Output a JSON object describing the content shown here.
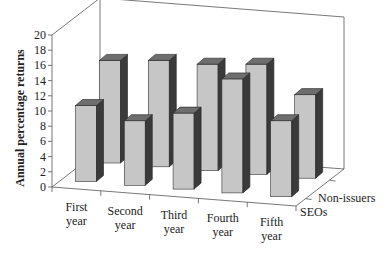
{
  "chart_data": {
    "type": "bar",
    "variant": "3d-grouped",
    "title": "",
    "xlabel": "",
    "ylabel": "Annual percentage returns",
    "ylim": [
      0,
      20
    ],
    "yticks": [
      0,
      2,
      4,
      6,
      8,
      10,
      12,
      14,
      16,
      18,
      20
    ],
    "categories": [
      "First year",
      "Second year",
      "Third year",
      "Fourth year",
      "Fifth year"
    ],
    "category_lines": [
      [
        "First",
        "year"
      ],
      [
        "Second",
        "year"
      ],
      [
        "Third",
        "year"
      ],
      [
        "Fourth",
        "year"
      ],
      [
        "Fifth",
        "year"
      ]
    ],
    "series": [
      {
        "name": "SEOs",
        "values": [
          10,
          8.5,
          10,
          15,
          10
        ]
      },
      {
        "name": "Non-issuers",
        "values": [
          13.5,
          14,
          14,
          14.5,
          11
        ]
      }
    ],
    "depth_labels": [
      "Non-issuers",
      "SEOs"
    ],
    "grid": false,
    "legend": "none (series labelled on depth axis)",
    "colors": {
      "bar_front": "#c6c6c6",
      "bar_side": "#3a3a3a",
      "bar_top": "#6e6e6e",
      "axis": "#555555"
    }
  }
}
